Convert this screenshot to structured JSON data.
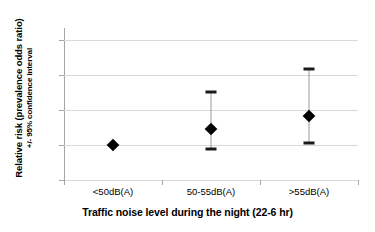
{
  "chart_data": {
    "type": "scatter",
    "title": "",
    "xlabel": "Traffic noise level during the night (22-6 hr)",
    "ylabel_line1": "Relative risk (prevalence odds ratio)",
    "ylabel_line2": "+/- 95% confidence interval",
    "categories": [
      "<50dB(A)",
      "50-55dB(A)",
      ">55dB(A)"
    ],
    "values": [
      1.0,
      1.47,
      1.84
    ],
    "ci_lower": [
      1.0,
      0.89,
      1.05
    ],
    "ci_upper": [
      1.0,
      2.51,
      3.19
    ],
    "has_errorbar": [
      false,
      true,
      true
    ],
    "ylim": [
      0,
      4.3
    ],
    "yticks": [
      0,
      1,
      2,
      3,
      4
    ],
    "ytick_labels": [
      "0",
      "1",
      "2",
      "3",
      "4"
    ],
    "grid": "horizontal",
    "legend": "none",
    "marker": "diamond",
    "marker_color": "#000000",
    "errorbar_color": "#9a9a9a",
    "gridline_color": "#d9d9d9",
    "axis_color": "#a6a6a6",
    "background_color": "#ffffff"
  }
}
